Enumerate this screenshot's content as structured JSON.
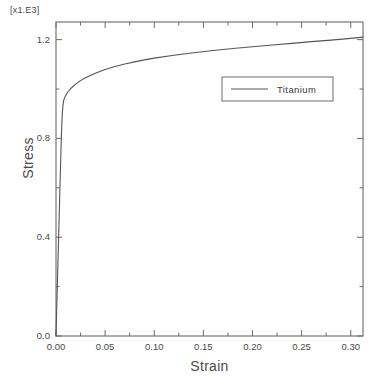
{
  "chart_data": {
    "type": "line",
    "title": "",
    "xlabel": "Strain",
    "ylabel": "Stress",
    "y_exponent_label": "[x1.E3]",
    "xlim": [
      0.0,
      0.3125
    ],
    "ylim": [
      0.0,
      1.2714
    ],
    "grid": false,
    "legend_position": "upper right inside plot",
    "x_major_ticks": [
      0.0,
      0.05,
      0.1,
      0.15,
      0.2,
      0.25,
      0.3
    ],
    "x_tick_labels": [
      "0.00",
      "0.05",
      "0.10",
      "0.15",
      "0.20",
      "0.25",
      "0.30"
    ],
    "x_minor_ticks": [
      0.025,
      0.075,
      0.125,
      0.175,
      0.225,
      0.275
    ],
    "y_major_ticks": [
      0.0,
      0.4,
      0.8,
      1.2
    ],
    "y_tick_labels": [
      "0.0",
      "0.4",
      "0.8",
      "1.2"
    ],
    "y_minor_ticks": [
      0.2,
      0.6,
      1.0
    ],
    "series": [
      {
        "name": "Titanium",
        "color": "#555555",
        "points": [
          [
            0.0,
            0.0
          ],
          [
            0.001,
            0.15
          ],
          [
            0.002,
            0.3
          ],
          [
            0.003,
            0.45
          ],
          [
            0.004,
            0.6
          ],
          [
            0.005,
            0.742
          ],
          [
            0.0055,
            0.808
          ],
          [
            0.006,
            0.865
          ],
          [
            0.0065,
            0.905
          ],
          [
            0.007,
            0.93
          ],
          [
            0.0075,
            0.946
          ],
          [
            0.008,
            0.956
          ],
          [
            0.009,
            0.967
          ],
          [
            0.01,
            0.975
          ],
          [
            0.012,
            0.988
          ],
          [
            0.015,
            1.002
          ],
          [
            0.02,
            1.02
          ],
          [
            0.025,
            1.034
          ],
          [
            0.03,
            1.046
          ],
          [
            0.04,
            1.064
          ],
          [
            0.05,
            1.079
          ],
          [
            0.06,
            1.091
          ],
          [
            0.07,
            1.101
          ],
          [
            0.08,
            1.11
          ],
          [
            0.09,
            1.118
          ],
          [
            0.1,
            1.125
          ],
          [
            0.12,
            1.137
          ],
          [
            0.14,
            1.147
          ],
          [
            0.16,
            1.156
          ],
          [
            0.18,
            1.164
          ],
          [
            0.2,
            1.171
          ],
          [
            0.22,
            1.178
          ],
          [
            0.24,
            1.185
          ],
          [
            0.26,
            1.192
          ],
          [
            0.28,
            1.198
          ],
          [
            0.3,
            1.205
          ],
          [
            0.3125,
            1.21
          ]
        ]
      }
    ]
  },
  "legend": {
    "entries": [
      {
        "label": "Titanium"
      }
    ]
  },
  "axes": {
    "y_exponent": "[x1.E3]",
    "y_title": "Stress",
    "x_title": "Strain"
  }
}
